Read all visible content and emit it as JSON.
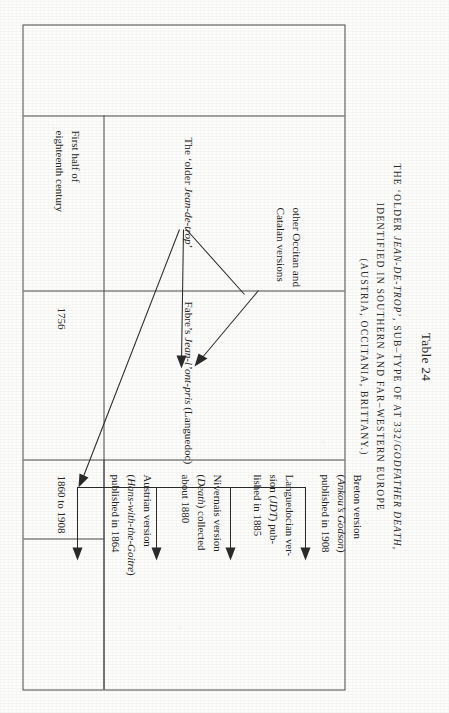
{
  "page": {
    "table_number": "Table 24",
    "caption_line1_pre": "THE ‘OLDER ",
    "caption_line1_italic": "JEAN-DE-TROP",
    "caption_line1_post": "’, SUB–TYPE OF AT 332/",
    "caption_line1_italic2": "GODFATHER DEATH",
    "caption_line1_end": ",",
    "caption_line2": "IDENTIFIED IN SOUTHERN AND FAR–WESTERN EUROPE",
    "caption_line3": "(AUSTRIA, OCCITANIA, BRITTANY.)"
  },
  "date_column": {
    "header_note": "",
    "rows": [
      {
        "label": "First half of\neighteenth century"
      },
      {
        "label": "1756"
      },
      {
        "label": "1860 to 1908"
      }
    ],
    "row1_line1": "First half of",
    "row1_line2": "eighteenth century",
    "row2": "1756",
    "row3": "1860 to 1908"
  },
  "diagram": {
    "nodes": [
      {
        "id": "older-jean-de-trop",
        "pre": "The ‘older ",
        "italic": "Jean-de-trop",
        "post": "’"
      },
      {
        "id": "other-occitan-catalan",
        "line1": "other Occitan and",
        "line2": "Catalan versions"
      },
      {
        "id": "fabre-jean-lont-pris",
        "pre": "Fabre’s ",
        "italic": "Jean-l’ont-pris",
        "post": " (Languedoc)"
      },
      {
        "id": "breton-version",
        "line1": "Breton version",
        "italic": "Ankou’s Godson",
        "line3": "published in 1908"
      },
      {
        "id": "languedocian-version",
        "line1": "Languedocian ver-",
        "line2_pre": "sion (",
        "line2_italic": "JDT",
        "line2_post": ") pub-",
        "line3": "lished in 1885"
      },
      {
        "id": "nivernais-version",
        "line1": "Nivernais version",
        "italic": "Death",
        "line3": "about 1880",
        "line2_post": ") collected"
      },
      {
        "id": "austrian-version",
        "line1": "Austrian version",
        "italic": "Hans-with-the-Goitre",
        "line3": "published in 1864"
      }
    ]
  },
  "colors": {
    "ink": "#2b2b2b",
    "rule": "#4a4a4a",
    "paper": "#fdfdfc"
  }
}
